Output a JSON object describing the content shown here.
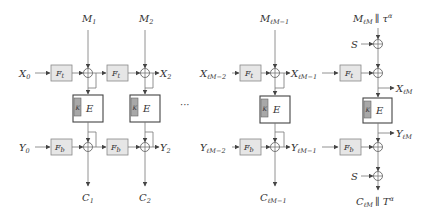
{
  "diagram": {
    "type": "authenticated-encryption block diagram",
    "colors": {
      "f_box_fill": "#e6e6e6",
      "k_box_fill": "#a8a8a8",
      "line": "#777777",
      "text": "#333333"
    },
    "columns": [
      {
        "id": "col1",
        "message": "M",
        "message_sub": "1",
        "x_in": "X",
        "x_in_sub": "0",
        "y_in": "Y",
        "y_in_sub": "0",
        "cipher": "C",
        "cipher_sub": "1",
        "f_top": "F",
        "f_top_sub": "t",
        "f_bot": "F",
        "f_bot_sub": "b",
        "e_label": "E",
        "k_label": "K"
      },
      {
        "id": "col2",
        "message": "M",
        "message_sub": "2",
        "x_out": "X",
        "x_out_sub": "2",
        "y_out": "Y",
        "y_out_sub": "2",
        "cipher": "C",
        "cipher_sub": "2",
        "f_top": "F",
        "f_top_sub": "t",
        "f_bot": "F",
        "f_bot_sub": "b",
        "e_label": "E",
        "k_label": "K"
      },
      {
        "id": "col-lm1",
        "message": "M",
        "message_sub": "ℓM−1",
        "x_in": "X",
        "x_in_sub": "ℓM−2",
        "y_in": "Y",
        "y_in_sub": "ℓM−2",
        "x_out": "X",
        "x_out_sub": "ℓM−1",
        "y_out": "Y",
        "y_out_sub": "ℓM−1",
        "cipher": "C",
        "cipher_sub": "ℓM−1",
        "f_top": "F",
        "f_top_sub": "t",
        "f_bot": "F",
        "f_bot_sub": "b",
        "e_label": "E",
        "k_label": "K"
      },
      {
        "id": "col-final",
        "message": "M",
        "message_sub": "ℓM",
        "message_suffix": "∥ τ",
        "message_suffix_sup": "α",
        "s_label": "S",
        "x_out": "X",
        "x_out_sub": "ℓM",
        "y_out": "Y",
        "y_out_sub": "ℓM",
        "cipher": "C",
        "cipher_sub": "ℓM",
        "cipher_suffix": "∥ T",
        "cipher_suffix_sup": "α",
        "f_top": "F",
        "f_top_sub": "t",
        "f_bot": "F",
        "f_bot_sub": "b",
        "e_label": "E",
        "k_label": "K"
      }
    ],
    "ellipsis": "···"
  }
}
